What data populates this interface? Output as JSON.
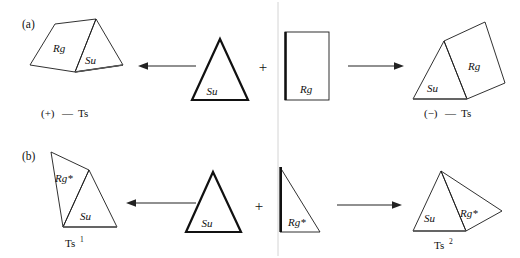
{
  "figure": {
    "background_color": "#ffffff",
    "ink_color": "#111111",
    "width": 520,
    "height": 258
  },
  "panels": [
    {
      "id": "a",
      "label": "(a)",
      "product_left": {
        "shape": "triangle-prism-composite",
        "parts": [
          {
            "name": "Rg",
            "label": "Rg"
          },
          {
            "name": "Su",
            "label": "Su"
          }
        ],
        "caption": "(+)—Ts",
        "caption_sign": "(+)",
        "caption_dash": "—",
        "caption_term": "Ts"
      },
      "reactant_center": {
        "shape": "equilateral-triangle",
        "label": "Su",
        "emphasis": "bold"
      },
      "operator": "+",
      "reactant_right": {
        "shape": "rectangle",
        "label": "Rg",
        "emphasis": "bold-left-edge"
      },
      "product_right": {
        "shape": "triangle-prism-composite",
        "parts": [
          {
            "name": "Su",
            "label": "Su"
          },
          {
            "name": "Rg",
            "label": "Rg"
          }
        ],
        "caption": "(−)—Ts",
        "caption_sign": "(−)",
        "caption_dash": "—",
        "caption_term": "Ts"
      },
      "arrow_left": {
        "direction": "left",
        "head": "left"
      },
      "arrow_right": {
        "direction": "right",
        "head": "right"
      }
    },
    {
      "id": "b",
      "label": "(b)",
      "product_left": {
        "shape": "triangle-wedge-composite",
        "parts": [
          {
            "name": "Rg*",
            "label": "Rg*"
          },
          {
            "name": "Su",
            "label": "Su"
          }
        ],
        "caption": "Ts",
        "caption_sup": "1"
      },
      "reactant_center": {
        "shape": "equilateral-triangle",
        "label": "Su",
        "emphasis": "bold"
      },
      "operator": "+",
      "reactant_right": {
        "shape": "right-triangle",
        "label": "Rg*",
        "emphasis": "bold-left-edge"
      },
      "product_right": {
        "shape": "triangle-wedge-composite",
        "parts": [
          {
            "name": "Su",
            "label": "Su"
          },
          {
            "name": "Rg*",
            "label": "Rg*"
          }
        ],
        "caption": "Ts",
        "caption_sup": "2"
      },
      "arrow_left": {
        "direction": "left",
        "head": "left"
      },
      "arrow_right": {
        "direction": "right",
        "head": "right"
      }
    }
  ],
  "labels": {
    "panel_a": "(a)",
    "panel_b": "(b)",
    "su": "Su",
    "rg": "Rg",
    "rg_star": "Rg*",
    "plus": "+",
    "ts": "Ts",
    "plus_sign_paren": "(+)",
    "minus_sign_paren": "(−)",
    "em_dash": "—",
    "sup_one": "1",
    "sup_two": "2"
  }
}
